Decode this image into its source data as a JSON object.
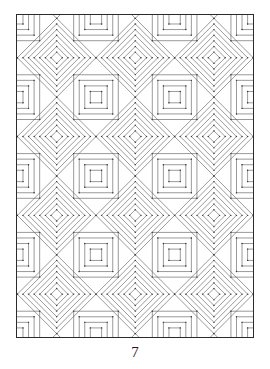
{
  "page": {
    "number": "7",
    "width": 270,
    "height": 369,
    "background_color": "#ffffff"
  },
  "frame": {
    "x": 16,
    "y": 14,
    "width": 238,
    "height": 324,
    "border_color": "#2b2b2b",
    "border_width": 1.4,
    "fill_color": "#ffffff"
  },
  "pattern": {
    "title": "Concentric diamonds and squares tessellation",
    "type": "geometric-tessellation",
    "grid": {
      "cell_size": 79.3,
      "columns": 3,
      "rows": 4,
      "origin_x": 40,
      "origin_y": 43,
      "center_offset_x": 39.65,
      "center_offset_y": 39.65
    },
    "line_color": "#555555",
    "line_color_light": "#8a8a8a",
    "line_width": 0.6,
    "diamond": {
      "rings": 7,
      "max_radius": 39.65,
      "ring_step": 5.66,
      "corner_dots": true,
      "dot_color": "#3a3a3a",
      "dot_radius": 0.7
    },
    "square": {
      "rings": 4,
      "max_half_size": 22.5,
      "ring_step": 5.6,
      "corner_dots": true,
      "dot_color": "#3a3a3a",
      "dot_radius": 0.7
    },
    "motif_order": [
      "diamond",
      "square"
    ]
  },
  "chart_data": {
    "type": "table",
    "categories": [
      "diamond-rings",
      "square-rings",
      "grid-columns",
      "grid-rows"
    ],
    "values": [
      7,
      4,
      3,
      4
    ],
    "xlabel": "",
    "ylabel": ""
  }
}
